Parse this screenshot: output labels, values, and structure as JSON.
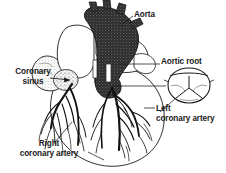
{
  "figure": {
    "background_color": "#ffffff",
    "ink_color": "#1a1a1a",
    "width": 226,
    "height": 173
  },
  "labels": {
    "aorta": "Aorta",
    "aortic_root": "Aortic root",
    "coronary_sinus_line1": "Coronary",
    "coronary_sinus_line2": "sinus",
    "left_coronary_line1": "Left",
    "left_coronary_line2": "coronary artery",
    "right_coronary_line1": "Right",
    "right_coronary_line2": "coronary artery"
  },
  "structures": [
    {
      "name": "aorta",
      "shading": "dark-stipple",
      "description": "Ascending aorta and arch with brachiocephalic branches"
    },
    {
      "name": "pulmonary-trunk",
      "shading": "light-outline",
      "description": "Pulmonary trunk anterior to aorta"
    },
    {
      "name": "right-atrial-appendage",
      "shading": "light-outline",
      "description": "Right atrial appendage at left of image"
    },
    {
      "name": "coronary-sinus",
      "shading": "stipple",
      "description": "Coronary sinus indicated by arrow"
    },
    {
      "name": "left-coronary-artery-tree",
      "shading": "solid-black",
      "description": "Left coronary artery branching over left ventricle"
    },
    {
      "name": "right-coronary-artery-tree",
      "shading": "solid-black",
      "description": "Right coronary artery branching over right ventricle"
    },
    {
      "name": "ventricle-mass",
      "shading": "outline",
      "description": "Ventricular mass forming rounded heart silhouette"
    },
    {
      "name": "aortic-root-inset",
      "shading": "outline-stipple",
      "description": "Cross-sectional inset of aortic root showing three semilunar valve cusps"
    }
  ]
}
